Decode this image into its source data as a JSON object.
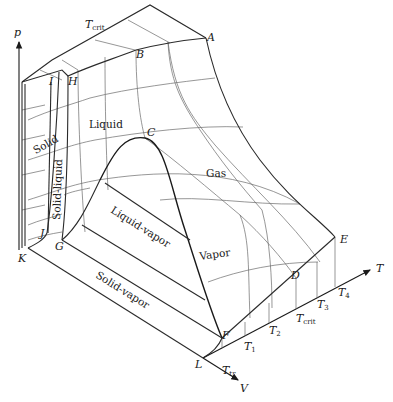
{
  "diagram": {
    "axes": {
      "p": "p",
      "V": "V",
      "T": "T"
    },
    "points": {
      "A": "A",
      "B": "B",
      "C": "C",
      "D": "D",
      "E": "E",
      "F": "F",
      "G": "G",
      "H": "H",
      "I": "I",
      "J": "J",
      "K": "K",
      "L": "L"
    },
    "regions": {
      "solid": "Solid",
      "solid_liquid": "Solid-liquid",
      "liquid": "Liquid",
      "gas": "Gas",
      "liquid_vapor": "Liquid-vapor",
      "vapor": "Vapor",
      "solid_vapor": "Solid-vapor"
    },
    "temperatures": {
      "t_crit_top": {
        "main": "T",
        "sub": "crit"
      },
      "t_tr": {
        "main": "T",
        "sub": "tr"
      },
      "t1": {
        "main": "T",
        "sub": "1"
      },
      "t2": {
        "main": "T",
        "sub": "2"
      },
      "t_crit": {
        "main": "T",
        "sub": "crit"
      },
      "t3": {
        "main": "T",
        "sub": "3"
      },
      "t4": {
        "main": "T",
        "sub": "4"
      }
    },
    "colors": {
      "line": "#1a1a1a",
      "grid": "#6a6a6a",
      "background": "#ffffff"
    }
  }
}
